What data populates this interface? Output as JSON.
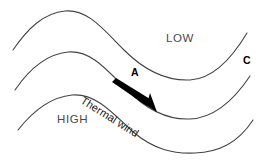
{
  "figure": {
    "name": "thermal-wind-diagram",
    "background_color": "#ffffff",
    "line_color": "#444444",
    "arrow_color": "#000000"
  },
  "labels": {
    "low": "LOW",
    "high": "HIGH",
    "point_a": "A",
    "point_c": "C",
    "thermal_wind": "Thermal wind"
  },
  "diagram_data": {
    "type": "schematic",
    "description": "Three wave-shaped isobaric contours with a thermal wind vector arrow between the upper and middle contours",
    "isolines": [
      {
        "id": "upper-contour",
        "start": [
          13,
          50
        ],
        "crest": [
          65,
          11
        ],
        "trough": [
          190,
          80
        ],
        "end": [
          247,
          33
        ]
      },
      {
        "id": "middle-contour",
        "start": [
          15,
          90
        ],
        "crest": [
          68,
          52
        ],
        "trough": [
          190,
          119
        ],
        "end": [
          250,
          76
        ]
      },
      {
        "id": "lower-contour",
        "start": [
          18,
          130
        ],
        "crest": [
          72,
          95
        ],
        "trough": [
          195,
          153
        ],
        "end": [
          253,
          120
        ]
      }
    ],
    "arrow": {
      "id": "thermal-wind-vector",
      "tail": [
        113,
        84
      ],
      "tip": [
        157,
        112
      ],
      "angle_deg": 32,
      "style": "solid-filled-tapered"
    },
    "annotations": [
      {
        "text": "LOW",
        "x": 186,
        "y": 40
      },
      {
        "text": "HIGH",
        "x": 79,
        "y": 121
      },
      {
        "text": "A",
        "x": 135,
        "y": 73
      },
      {
        "text": "C",
        "x": 246,
        "y": 61
      },
      {
        "text": "Thermal wind",
        "x": 88,
        "y": 88,
        "rotation_deg": 32
      }
    ]
  }
}
